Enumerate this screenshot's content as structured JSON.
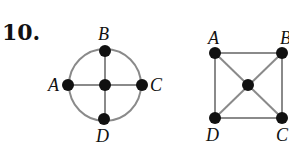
{
  "problem_number": "10.",
  "graphs": [
    {
      "name": "circle-cross-graph",
      "labels": {
        "A": "A",
        "B": "B",
        "C": "C",
        "D": "D"
      }
    },
    {
      "name": "square-diagonals-graph",
      "labels": {
        "A": "A",
        "B": "B",
        "C": "C",
        "D": "D"
      }
    }
  ],
  "colors": {
    "edge": "#8a8a8a",
    "node": "#111111",
    "text": "#111111"
  }
}
